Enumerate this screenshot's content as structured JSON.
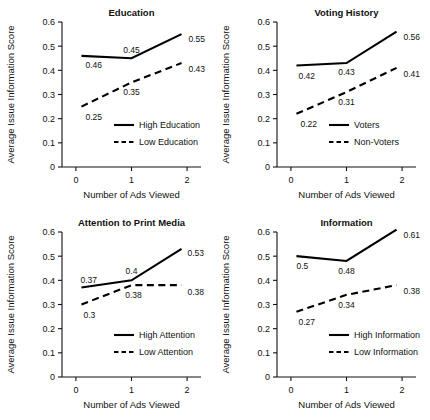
{
  "figure": {
    "panel_count": 4,
    "shared": {
      "ylabel": "Average Issue Information Score",
      "xlabel": "Number of Ads Viewed",
      "xticks": [
        "0",
        "1",
        "2"
      ],
      "yticks": [
        "0",
        "0.1",
        "0.2",
        "0.3",
        "0.4",
        "0.5",
        "0.6"
      ]
    }
  },
  "chart_data": [
    {
      "type": "line",
      "title": "Education",
      "xlabel": "Number of Ads Viewed",
      "ylabel": "Average Issue Information Score",
      "x": [
        0,
        1,
        2
      ],
      "xtick_labels": [
        "0",
        "1",
        "2"
      ],
      "ytick_labels": [
        "0",
        "0.1",
        "0.2",
        "0.3",
        "0.4",
        "0.5",
        "0.6"
      ],
      "xlim": [
        -0.25,
        2.25
      ],
      "ylim": [
        0,
        0.6
      ],
      "grid": false,
      "legend_position": "lower-right-inside",
      "series": [
        {
          "name": "High Education",
          "style": "solid",
          "values": [
            0.46,
            0.45,
            0.55
          ],
          "labels": [
            "0.46",
            "0.45",
            "0.55"
          ]
        },
        {
          "name": "Low Education",
          "style": "dashed",
          "values": [
            0.25,
            0.35,
            0.43
          ],
          "labels": [
            "0.25",
            "0.35",
            "0.43"
          ]
        }
      ]
    },
    {
      "type": "line",
      "title": "Voting History",
      "xlabel": "Number of Ads Viewed",
      "ylabel": "Average Issue Information Score",
      "x": [
        0,
        1,
        2
      ],
      "xtick_labels": [
        "0",
        "1",
        "2"
      ],
      "ytick_labels": [
        "0",
        "0.1",
        "0.2",
        "0.3",
        "0.4",
        "0.5",
        "0.6"
      ],
      "xlim": [
        -0.25,
        2.25
      ],
      "ylim": [
        0,
        0.6
      ],
      "grid": false,
      "legend_position": "lower-right-inside",
      "series": [
        {
          "name": "Voters",
          "style": "solid",
          "values": [
            0.42,
            0.43,
            0.56
          ],
          "labels": [
            "0.42",
            "0.43",
            "0.56"
          ]
        },
        {
          "name": "Non-Voters",
          "style": "dashed",
          "values": [
            0.22,
            0.31,
            0.41
          ],
          "labels": [
            "0.22",
            "0.31",
            "0.41"
          ]
        }
      ]
    },
    {
      "type": "line",
      "title": "Attention to Print Media",
      "xlabel": "Number of Ads Viewed",
      "ylabel": "Average Issue Information Score",
      "x": [
        0,
        1,
        2
      ],
      "xtick_labels": [
        "0",
        "1",
        "2"
      ],
      "ytick_labels": [
        "0",
        "0.1",
        "0.2",
        "0.3",
        "0.4",
        "0.5",
        "0.6"
      ],
      "xlim": [
        -0.25,
        2.25
      ],
      "ylim": [
        0,
        0.6
      ],
      "grid": false,
      "legend_position": "lower-right-inside",
      "series": [
        {
          "name": "High Attention",
          "style": "solid",
          "values": [
            0.37,
            0.4,
            0.53
          ],
          "labels": [
            "0.37",
            "0.4",
            "0.53"
          ]
        },
        {
          "name": "Low Attention",
          "style": "dashed",
          "values": [
            0.3,
            0.38,
            0.38
          ],
          "labels": [
            "0.3",
            "0.38",
            "0.38"
          ]
        }
      ]
    },
    {
      "type": "line",
      "title": "Information",
      "xlabel": "Number of Ads Viewed",
      "ylabel": "Average Issue Information Score",
      "x": [
        0,
        1,
        2
      ],
      "xtick_labels": [
        "0",
        "1",
        "2"
      ],
      "ytick_labels": [
        "0",
        "0.1",
        "0.2",
        "0.3",
        "0.4",
        "0.5",
        "0.6"
      ],
      "xlim": [
        -0.25,
        2.25
      ],
      "ylim": [
        0,
        0.6
      ],
      "grid": false,
      "legend_position": "lower-right-inside",
      "series": [
        {
          "name": "High Information",
          "style": "solid",
          "values": [
            0.5,
            0.48,
            0.61
          ],
          "labels": [
            "0.5",
            "0.48",
            "0.61"
          ]
        },
        {
          "name": "Low Information",
          "style": "dashed",
          "values": [
            0.27,
            0.34,
            0.38
          ],
          "labels": [
            "0.27",
            "0.34",
            "0.38"
          ]
        }
      ]
    }
  ]
}
